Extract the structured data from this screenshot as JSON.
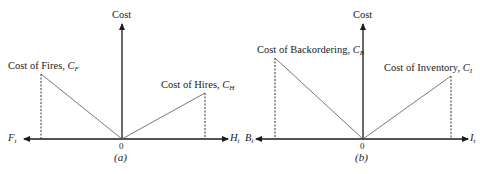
{
  "diagrams": [
    {
      "id": "a",
      "caption": "(a)",
      "y_axis_label": "Cost",
      "origin_label": "0",
      "left_axis": {
        "var": "F",
        "sub": "t"
      },
      "right_axis": {
        "var": "H",
        "sub": "t"
      },
      "left_line": {
        "label_text": "Cost of Fires, ",
        "symbol": "C",
        "sub": "F"
      },
      "right_line": {
        "label_text": "Cost of Hires, ",
        "symbol": "C",
        "sub": "H"
      }
    },
    {
      "id": "b",
      "caption": "(b)",
      "y_axis_label": "Cost",
      "origin_label": "0",
      "left_axis": {
        "var": "B",
        "sub": "t"
      },
      "right_axis": {
        "var": "I",
        "sub": "t"
      },
      "left_line": {
        "label_text": "Cost of Backordering, ",
        "symbol": "C",
        "sub": "B"
      },
      "right_line": {
        "label_text": "Cost of Inventory, ",
        "symbol": "C",
        "sub": "I"
      }
    }
  ]
}
